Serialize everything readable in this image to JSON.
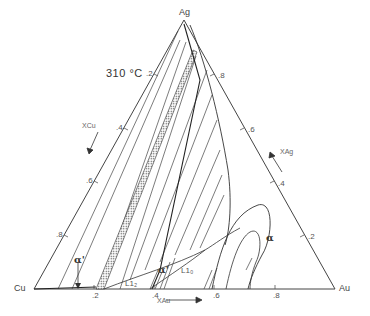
{
  "title": "310 °C",
  "vertices": {
    "top": {
      "label": "Ag",
      "sub": "g"
    },
    "left": {
      "label": "Cu"
    },
    "right": {
      "label": "Au"
    }
  },
  "axes": {
    "left": {
      "label": "XCu",
      "ticks": [
        ".2",
        ".4",
        ".6",
        ".8"
      ]
    },
    "right": {
      "label": "XAg",
      "ticks": [
        ".8",
        ".6",
        ".4",
        ".2"
      ]
    },
    "bottom": {
      "label": "XAu",
      "ticks": [
        ".2",
        ".4",
        ".6",
        ".8"
      ]
    }
  },
  "phases": {
    "alpha_main": "α",
    "alpha_prime": "α'",
    "alpha_inner": "α'",
    "l12": "L1₂",
    "l10": "L1₀"
  },
  "colors": {
    "line": "#333333",
    "hatch": "#555555",
    "text": "#444444"
  }
}
